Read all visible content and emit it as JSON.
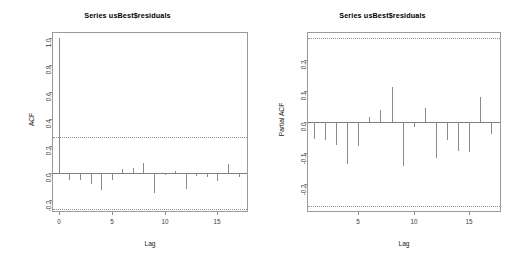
{
  "figure": {
    "width": 510,
    "height": 263,
    "background": "#ffffff",
    "line_color": "#8a8a8a",
    "ci_color": "#8f8f8f",
    "panels": 2
  },
  "chart_data": [
    {
      "type": "bar",
      "name": "acf",
      "title": "Series  usBest$residuals",
      "xlabel": "Lag",
      "ylabel": "ACF",
      "grid": false,
      "legend": "none",
      "xlim": [
        -0.55,
        17.8
      ],
      "ylim": [
        -0.285,
        1.04
      ],
      "xticks": [
        0,
        5,
        10,
        15
      ],
      "xtick_labels": [
        "0",
        "5",
        "10",
        "15"
      ],
      "yticks": [
        1.0,
        0.8,
        0.6,
        0.4,
        0.2,
        0.0,
        -0.2
      ],
      "ytick_labels": [
        "1.0",
        "0.8",
        "0.6",
        "0.4",
        "0.2",
        "0.0",
        "-0.2"
      ],
      "confidence_bands": [
        0.268,
        -0.268
      ],
      "x": [
        0,
        1,
        2,
        3,
        4,
        5,
        6,
        7,
        8,
        9,
        10,
        11,
        12,
        13,
        14,
        15,
        16,
        17
      ],
      "values": [
        1.0,
        -0.056,
        -0.053,
        -0.082,
        -0.131,
        -0.052,
        0.031,
        0.035,
        0.071,
        -0.148,
        -0.015,
        0.011,
        -0.124,
        -0.028,
        -0.03,
        -0.06,
        0.066,
        -0.03
      ]
    },
    {
      "type": "bar",
      "name": "pacf",
      "title": "Series  usBest$residuals",
      "xlabel": "Lag",
      "ylabel": "Partial ACF",
      "grid": false,
      "legend": "none",
      "xlim": [
        0.45,
        17.8
      ],
      "ylim": [
        -0.285,
        0.285
      ],
      "xticks": [
        5,
        10,
        15
      ],
      "xtick_labels": [
        "5",
        "10",
        "15"
      ],
      "yticks": [
        0.2,
        0.1,
        0.0,
        -0.1,
        -0.2
      ],
      "ytick_labels": [
        "0.2",
        "0.1",
        "0.0",
        "-0.1",
        "-0.2"
      ],
      "confidence_bands": [
        0.268,
        -0.268
      ],
      "x": [
        1,
        2,
        3,
        4,
        5,
        6,
        7,
        8,
        9,
        10,
        11,
        12,
        13,
        14,
        15,
        16,
        17
      ],
      "values": [
        -0.056,
        -0.057,
        -0.074,
        -0.134,
        -0.077,
        0.017,
        0.04,
        0.112,
        -0.142,
        -0.015,
        0.045,
        -0.116,
        -0.058,
        -0.092,
        -0.097,
        0.081,
        -0.04
      ]
    }
  ]
}
